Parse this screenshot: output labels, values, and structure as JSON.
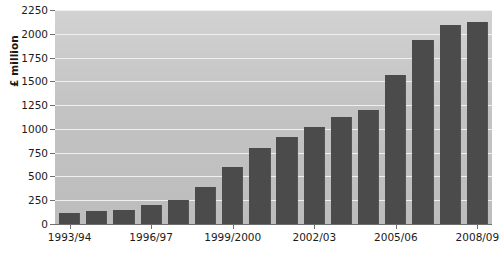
{
  "chart_data": {
    "type": "bar",
    "title": "",
    "xlabel": "",
    "ylabel": "£ million",
    "ylim": [
      0,
      2250
    ],
    "ytick_step": 250,
    "grid": true,
    "legend": "none",
    "bar_color": "#4b4b4b",
    "plot_background": "#c6c6c6",
    "gridline_color": "#f0f0f0",
    "axis_color": "#6f6f6f",
    "text_color": "#1a1a1a",
    "ytick_labels": [
      "0",
      "250",
      "500",
      "750",
      "1000",
      "1250",
      "1500",
      "1750",
      "2000",
      "2250"
    ],
    "ytick_values": [
      0,
      250,
      500,
      750,
      1000,
      1250,
      1500,
      1750,
      2000,
      2250
    ],
    "categories": [
      "1993/94",
      "1994/95",
      "1995/96",
      "1996/97",
      "1997/98",
      "1998/99",
      "1999/2000",
      "2000/01",
      "2001/02",
      "2002/03",
      "2003/04",
      "2004/05",
      "2005/06",
      "2006/07",
      "2007/08",
      "2008/09"
    ],
    "xtick_labels": [
      "1993/94",
      "1996/97",
      "1999/2000",
      "2002/03",
      "2005/06",
      "2008/09"
    ],
    "xtick_indices": [
      0,
      3,
      6,
      9,
      12,
      15
    ],
    "values": [
      120,
      140,
      150,
      195,
      255,
      385,
      600,
      800,
      910,
      1020,
      1120,
      1195,
      1570,
      1930,
      2090,
      2120
    ]
  }
}
